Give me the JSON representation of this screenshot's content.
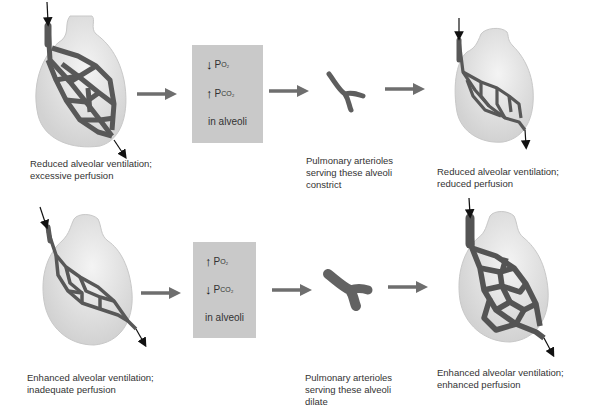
{
  "colors": {
    "vessel": "#5a5a5a",
    "alveolus": "#dcdcdc",
    "alveolus_highlight": "#f2f2f2",
    "box": "#c9c9c9",
    "arrow": "#6e6e6e"
  },
  "rows": [
    {
      "initial": {
        "label": "Reduced alveolar ventilation;\nexcessive perfusion"
      },
      "box": {
        "o2": {
          "direction": "down",
          "arrow": "↓",
          "symbol": "P",
          "sub": "O₂"
        },
        "co2": {
          "direction": "up",
          "arrow": "↑",
          "symbol": "P",
          "sub": "CO₂"
        },
        "footer": "in alveoli"
      },
      "arteriole": {
        "label": "Pulmonary arterioles\nserving these alveoli\nconstrict",
        "state": "constricted"
      },
      "result": {
        "label": "Reduced alveolar ventilation;\nreduced perfusion"
      }
    },
    {
      "initial": {
        "label": "Enhanced alveolar ventilation;\ninadequate perfusion"
      },
      "box": {
        "o2": {
          "direction": "up",
          "arrow": "↑",
          "symbol": "P",
          "sub": "O₂"
        },
        "co2": {
          "direction": "down",
          "arrow": "↓",
          "symbol": "P",
          "sub": "CO₂"
        },
        "footer": "in alveoli"
      },
      "arteriole": {
        "label": "Pulmonary arterioles\nserving these alveoli\ndilate",
        "state": "dilated"
      },
      "result": {
        "label": "Enhanced alveolar ventilation;\nenhanced perfusion"
      }
    }
  ]
}
